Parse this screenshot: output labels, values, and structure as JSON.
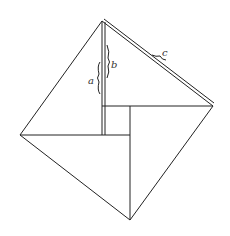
{
  "diagram": {
    "title": "",
    "labels": {
      "a": "a",
      "b": "b",
      "c": "c"
    },
    "colors": {
      "stroke": "#222222",
      "background": "#ffffff"
    }
  }
}
